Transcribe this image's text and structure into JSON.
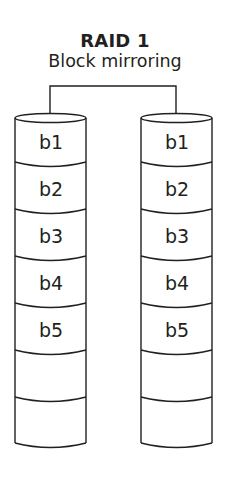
{
  "title": "RAID 1",
  "subtitle": "Block mirroring",
  "colors": {
    "stroke": "#231f20",
    "background": "#ffffff",
    "text": "#231f20"
  },
  "disks": [
    {
      "name": "disk-0",
      "blocks": [
        "b1",
        "b2",
        "b3",
        "b4",
        "b5",
        "",
        ""
      ]
    },
    {
      "name": "disk-1",
      "blocks": [
        "b1",
        "b2",
        "b3",
        "b4",
        "b5",
        "",
        ""
      ]
    }
  ],
  "connector": "mirror-link"
}
